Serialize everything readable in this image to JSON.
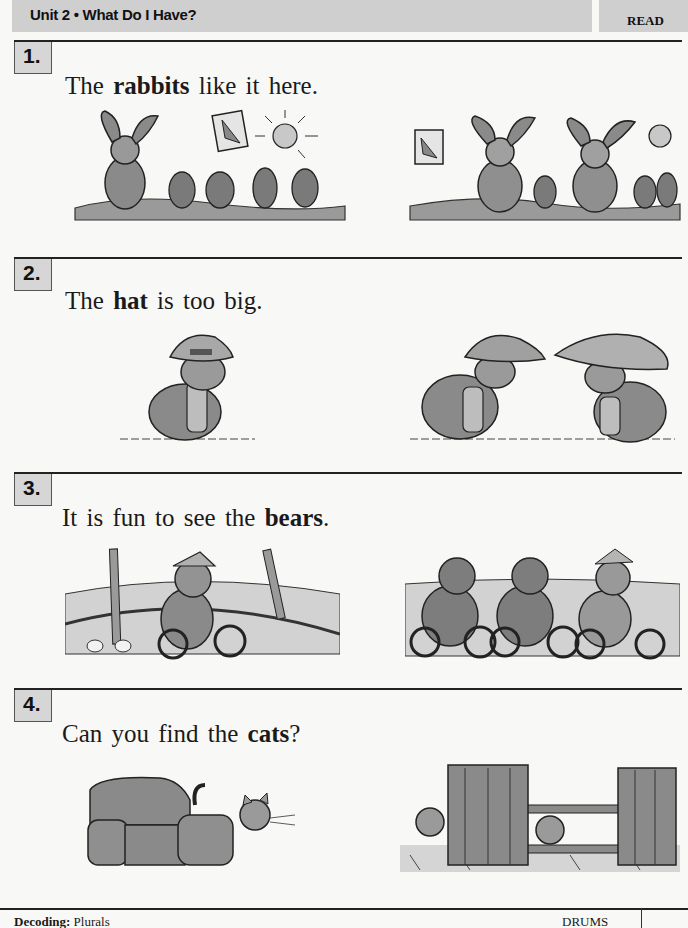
{
  "header": {
    "title": "Unit 2 • What Do I Have?",
    "tag": "READ"
  },
  "items": [
    {
      "number": "1.",
      "sentence": {
        "before": "The ",
        "bold": "rabbits",
        "after": " like it here."
      },
      "images": [
        {
          "description": "One rabbit in a carrot garden with a carrot sign and sun"
        },
        {
          "description": "Two rabbits in a carrot garden with a carrot sign and sun"
        }
      ]
    },
    {
      "number": "2.",
      "sentence": {
        "before": "The ",
        "bold": "hat",
        "after": " is too big."
      },
      "images": [
        {
          "description": "One turtle wearing a cap pulled over its eyes"
        },
        {
          "description": "Two turtles wearing hats facing each other"
        }
      ]
    },
    {
      "number": "3.",
      "sentence": {
        "before": "It is fun to see the ",
        "bold": "bears",
        "after": "."
      },
      "images": [
        {
          "description": "One bear in a party hat riding a tricycle in a circus ring"
        },
        {
          "description": "Three bears riding tricycles in a circus ring"
        }
      ]
    },
    {
      "number": "4.",
      "sentence": {
        "before": "Can you find the ",
        "bold": "cats",
        "after": "?"
      },
      "images": [
        {
          "description": "One cat peeking out from behind an armchair"
        },
        {
          "description": "Two cats peeking out from behind curtains by a window"
        }
      ]
    }
  ],
  "footer": {
    "skill_label": "Decoding:",
    "skill_value": " Plurals",
    "right_label": "DRUMS"
  }
}
